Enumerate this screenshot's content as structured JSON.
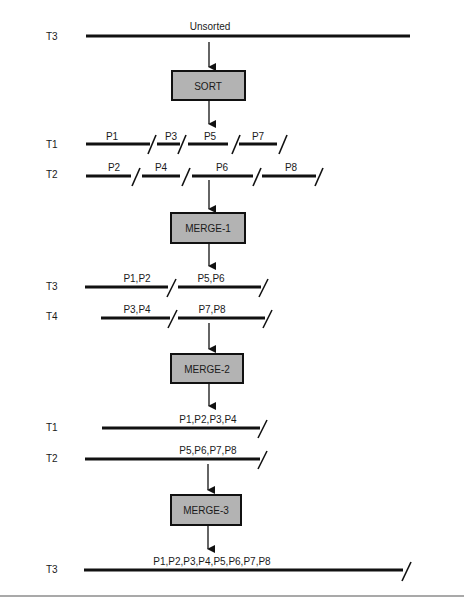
{
  "diagram": {
    "stage0": {
      "tape": "T3",
      "segments": [
        {
          "label": "Unsorted"
        }
      ]
    },
    "sort_box": {
      "label": "SORT"
    },
    "stage1": {
      "tapes": [
        {
          "tape": "T1",
          "segments": [
            {
              "label": "P1"
            },
            {
              "label": "P3"
            },
            {
              "label": "P5"
            },
            {
              "label": "P7"
            }
          ]
        },
        {
          "tape": "T2",
          "segments": [
            {
              "label": "P2"
            },
            {
              "label": "P4"
            },
            {
              "label": "P6"
            },
            {
              "label": "P8"
            }
          ]
        }
      ]
    },
    "merge1_box": {
      "label": "MERGE-1"
    },
    "stage2": {
      "tapes": [
        {
          "tape": "T3",
          "segments": [
            {
              "label": "P1,P2"
            },
            {
              "label": "P5,P6"
            }
          ]
        },
        {
          "tape": "T4",
          "segments": [
            {
              "label": "P3,P4"
            },
            {
              "label": "P7,P8"
            }
          ]
        }
      ]
    },
    "merge2_box": {
      "label": "MERGE-2"
    },
    "stage3": {
      "tapes": [
        {
          "tape": "T1",
          "segments": [
            {
              "label": "P1,P2,P3,P4"
            }
          ]
        },
        {
          "tape": "T2",
          "segments": [
            {
              "label": "P5,P6,P7,P8"
            }
          ]
        }
      ]
    },
    "merge3_box": {
      "label": "MERGE-3"
    },
    "stage4": {
      "tape": "T3",
      "segments": [
        {
          "label": "P1,P2,P3,P4,P5,P6,P7,P8"
        }
      ]
    },
    "colors": {
      "line": "#111111",
      "box_fill": "#b3b3b3",
      "rule": "#8c8c8c"
    }
  }
}
